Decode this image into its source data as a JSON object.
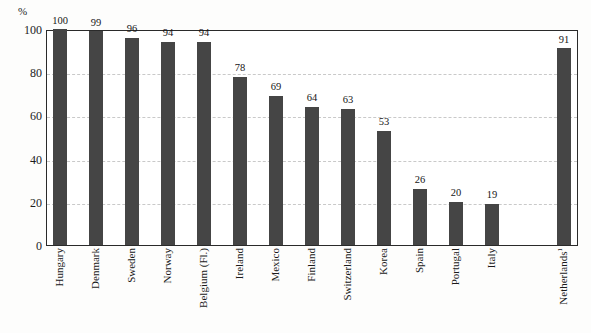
{
  "chart_data": {
    "type": "bar",
    "title": "",
    "xlabel": "",
    "ylabel": "%",
    "ylim": [
      0,
      100
    ],
    "yticks": [
      0,
      20,
      40,
      60,
      80,
      100
    ],
    "grid": true,
    "legend": "none",
    "categories": [
      "Hungary",
      "Denmark",
      "Sweden",
      "Norway",
      "Belgium (Fl.)",
      "Ireland",
      "Mexico",
      "Finland",
      "Switzerland",
      "Korea",
      "Spain",
      "Portugal",
      "Italy",
      "Netherlands"
    ],
    "values": [
      100,
      99,
      96,
      94,
      94,
      78,
      69,
      64,
      63,
      53,
      26,
      20,
      19,
      91
    ],
    "annotations": [
      {
        "category": "Netherlands",
        "footnote_marker": "1",
        "note": "separated from the main series by a gap"
      }
    ],
    "bar_color": "#454545",
    "gridline_color": "#c9c9c9",
    "axis_color": "#2a2a2a"
  },
  "axis": {
    "unit_label": "%",
    "tick_labels": [
      "100",
      "80",
      "60",
      "40",
      "20",
      "0"
    ]
  },
  "bars": [
    {
      "label": "Hungary",
      "value": 100,
      "value_text": "100",
      "footnote": ""
    },
    {
      "label": "Denmark",
      "value": 99,
      "value_text": "99",
      "footnote": ""
    },
    {
      "label": "Sweden",
      "value": 96,
      "value_text": "96",
      "footnote": ""
    },
    {
      "label": "Norway",
      "value": 94,
      "value_text": "94",
      "footnote": ""
    },
    {
      "label": "Belgium (Fl.)",
      "value": 94,
      "value_text": "94",
      "footnote": ""
    },
    {
      "label": "Ireland",
      "value": 78,
      "value_text": "78",
      "footnote": ""
    },
    {
      "label": "Mexico",
      "value": 69,
      "value_text": "69",
      "footnote": ""
    },
    {
      "label": "Finland",
      "value": 64,
      "value_text": "64",
      "footnote": ""
    },
    {
      "label": "Switzerland",
      "value": 63,
      "value_text": "63",
      "footnote": ""
    },
    {
      "label": "Korea",
      "value": 53,
      "value_text": "53",
      "footnote": ""
    },
    {
      "label": "Spain",
      "value": 26,
      "value_text": "26",
      "footnote": ""
    },
    {
      "label": "Portugal",
      "value": 20,
      "value_text": "20",
      "footnote": ""
    },
    {
      "label": "Italy",
      "value": 19,
      "value_text": "19",
      "footnote": ""
    },
    {
      "label": "Netherlands",
      "value": 91,
      "value_text": "91",
      "footnote": "1"
    }
  ]
}
